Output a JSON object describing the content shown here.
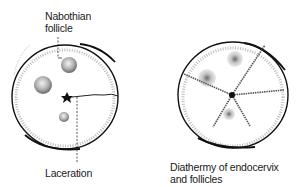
{
  "figures": [
    {
      "id": "left",
      "description": "Cervix with Nabothian follicles and laceration",
      "labels": {
        "top_line1": "Nabothian",
        "top_line2": "follicle",
        "bottom": "Laceration"
      }
    },
    {
      "id": "right",
      "description": "Treated cervix with radial diathermy lines",
      "labels": {
        "bottom_line1": "Diathermy of endocervix",
        "bottom_line2": "and follicles"
      }
    }
  ],
  "colors": {
    "ink": "#111111",
    "stipple": "#9a9a9a",
    "background": "#ffffff"
  }
}
